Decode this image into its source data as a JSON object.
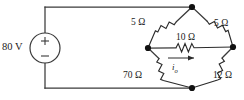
{
  "figure": {
    "name": "wheatstone-bridge-circuit"
  },
  "source": {
    "label": "80 V",
    "plus_sign": "+",
    "minus_sign": "−",
    "type": "independent-voltage-source"
  },
  "components": {
    "top_left_resistor": {
      "label": "5 Ω",
      "value": 5,
      "unit": "Ω"
    },
    "top_right_resistor": {
      "label": "5 Ω",
      "value": 5,
      "unit": "Ω"
    },
    "middle_resistor": {
      "label": "10 Ω",
      "value": 10,
      "unit": "Ω"
    },
    "bottom_left_resistor": {
      "label": "70 Ω",
      "value": 70,
      "unit": "Ω"
    },
    "bottom_right_resistor": {
      "label": "12 Ω",
      "value": 12,
      "unit": "Ω"
    }
  },
  "current": {
    "symbol": "i",
    "subscript": "o",
    "direction": "left-to-right"
  },
  "colors": {
    "wire": "#3a3a3a",
    "resistor": "#2b2b2b",
    "node": "#111111",
    "text": "#1a1a1a",
    "background": "#ffffff"
  }
}
